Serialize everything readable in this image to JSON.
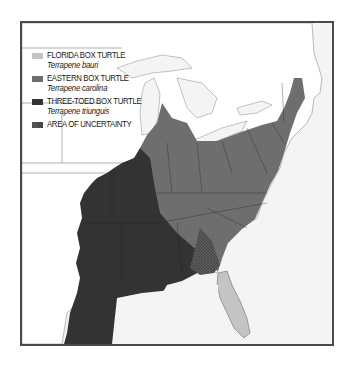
{
  "map": {
    "region": "Eastern United States",
    "frame_color": "#4a4a4a",
    "water_color": "#f4f4f4",
    "land_color": "#ffffff",
    "border_color": "#555555"
  },
  "legend": {
    "items": [
      {
        "common_name": "FLORIDA BOX TURTLE",
        "scientific_name": "Terrapene bauri",
        "color": "#c4c4c4",
        "pattern": "solid"
      },
      {
        "common_name": "EASTERN BOX TURTLE",
        "scientific_name": "Terrapene carolina",
        "color": "#6e6e6e",
        "pattern": "solid"
      },
      {
        "common_name": "THREE-TOED BOX TURTLE",
        "scientific_name": "Terrapene triunguis",
        "color": "#333333",
        "pattern": "solid"
      },
      {
        "common_name": "AREA OF UNCERTAINTY",
        "scientific_name": "",
        "color": "#5a5a5a",
        "pattern": "crosshatch"
      }
    ]
  }
}
